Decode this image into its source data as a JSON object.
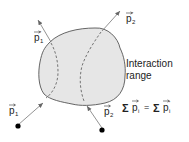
{
  "diagram": {
    "labels": {
      "p1_in": "p",
      "p1_in_sub": "1",
      "p2_in": "p",
      "p2_in_sub": "2",
      "p1_out": "p",
      "p1_out_sub": "1",
      "p1_out_prime": "'",
      "p2_out": "p",
      "p2_out_sub": "2",
      "p2_out_prime": "'",
      "range_line1": "Interaction",
      "range_line2": "range",
      "eq_sigma_left": "Σ",
      "eq_p_left": "p",
      "eq_sub_left": "i",
      "eq_equals": "=",
      "eq_sigma_right": "Σ",
      "eq_p_right": "p",
      "eq_sub_right": "i",
      "eq_prime_right": "'"
    },
    "colors": {
      "blob_fill": "#e6e6e6",
      "blob_stroke": "#555555",
      "arrow": "#777777",
      "dot": "#000000"
    }
  }
}
